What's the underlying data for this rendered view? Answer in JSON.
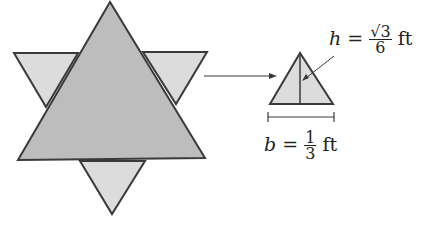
{
  "figure": {
    "colors": {
      "large_fill": "#bdbdbd",
      "small_fill": "#dcdcdc",
      "stroke": "#3a3a3a",
      "background": "#ffffff"
    },
    "height_label": {
      "var": "h",
      "eq": "=",
      "num": "√3",
      "den": "6",
      "unit": "ft"
    },
    "base_label": {
      "var": "b",
      "eq": "=",
      "num": "1",
      "den": "3",
      "unit": "ft"
    }
  }
}
